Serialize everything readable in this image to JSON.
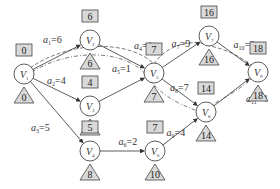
{
  "diagram": {
    "type": "activity-on-edge network (critical path)",
    "nodes": [
      {
        "id": "V1",
        "label": "V",
        "sub": "1",
        "x": 24,
        "y": 74,
        "earliest": "0",
        "latest": "0"
      },
      {
        "id": "V2",
        "label": "V",
        "sub": "2",
        "x": 90,
        "y": 40,
        "earliest": "6",
        "latest": "6"
      },
      {
        "id": "V3",
        "label": "V",
        "sub": "3",
        "x": 90,
        "y": 106,
        "earliest": "4",
        "latest": "6"
      },
      {
        "id": "V4",
        "label": "V",
        "sub": "4",
        "x": 90,
        "y": 151,
        "earliest": "5",
        "latest": "8"
      },
      {
        "id": "V5",
        "label": "V",
        "sub": "5",
        "x": 154,
        "y": 73,
        "earliest": "7",
        "latest": "7"
      },
      {
        "id": "V6",
        "label": "V",
        "sub": "6",
        "x": 155,
        "y": 151,
        "earliest": "7",
        "latest": "10"
      },
      {
        "id": "V7",
        "label": "V",
        "sub": "7",
        "x": 209,
        "y": 36,
        "earliest": "16",
        "latest": "16"
      },
      {
        "id": "V8",
        "label": "V",
        "sub": "8",
        "x": 206,
        "y": 112,
        "earliest": "14",
        "latest": "14"
      },
      {
        "id": "V9",
        "label": "V",
        "sub": "9",
        "x": 258,
        "y": 72,
        "earliest": "18",
        "latest": "18"
      }
    ],
    "edges": [
      {
        "from": "V1",
        "to": "V2",
        "name": "a",
        "sub": "1",
        "weight": "=6"
      },
      {
        "from": "V1",
        "to": "V3",
        "name": "a",
        "sub": "2",
        "weight": "=4"
      },
      {
        "from": "V1",
        "to": "V4",
        "name": "a",
        "sub": "3",
        "weight": "=5"
      },
      {
        "from": "V2",
        "to": "V5",
        "name": "a",
        "sub": "4",
        "weight": "=1"
      },
      {
        "from": "V3",
        "to": "V5",
        "name": "a",
        "sub": "5",
        "weight": "=1"
      },
      {
        "from": "V4",
        "to": "V6",
        "name": "a",
        "sub": "6",
        "weight": "=2"
      },
      {
        "from": "V5",
        "to": "V7",
        "name": "a",
        "sub": "7",
        "weight": "=9"
      },
      {
        "from": "V5",
        "to": "V8",
        "name": "a",
        "sub": "8",
        "weight": "=7"
      },
      {
        "from": "V6",
        "to": "V8",
        "name": "a",
        "sub": "9",
        "weight": "=4"
      },
      {
        "from": "V7",
        "to": "V9",
        "name": "a",
        "sub": "10",
        "weight": "=2"
      },
      {
        "from": "V8",
        "to": "V9",
        "name": "a",
        "sub": "11",
        "weight": "=4"
      }
    ],
    "legend": {
      "box": "earliest event time",
      "triangle": "latest event time"
    }
  }
}
